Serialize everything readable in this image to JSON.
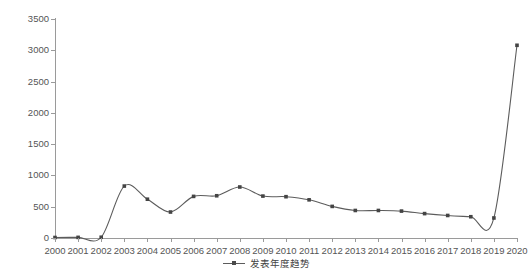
{
  "chart_data": {
    "type": "line",
    "title": "",
    "xlabel": "",
    "ylabel": "发文量（篇）",
    "categories": [
      "2000",
      "2001",
      "2002",
      "2003",
      "2004",
      "2005",
      "2006",
      "2007",
      "2008",
      "2009",
      "2010",
      "2011",
      "2012",
      "2013",
      "2014",
      "2015",
      "2016",
      "2017",
      "2018",
      "2019",
      "2020"
    ],
    "series": [
      {
        "name": "发表年度趋势",
        "values": [
          8,
          10,
          12,
          830,
          620,
          415,
          665,
          675,
          815,
          670,
          660,
          610,
          505,
          440,
          440,
          430,
          390,
          360,
          340,
          320,
          3080
        ]
      }
    ],
    "ylim": [
      0,
      3500
    ],
    "yticks": [
      0,
      500,
      1000,
      1500,
      2000,
      2500,
      3000,
      3500
    ],
    "ytick_labels": [
      "0",
      "500",
      "1000",
      "1500",
      "2000",
      "2500",
      "3000",
      "3500"
    ],
    "grid": false,
    "legend_position": "bottom-center",
    "line_color": "#5c5c5c",
    "marker_color": "#444444",
    "axis_color": "#9a9a9a",
    "background": "#ffffff"
  },
  "legend": {
    "entries": [
      {
        "label": "发表年度趋势"
      }
    ]
  },
  "axes": {
    "y_title": "发文量（篇）"
  }
}
